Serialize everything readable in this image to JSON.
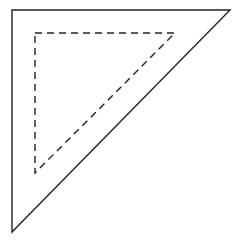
{
  "diagram": {
    "width": 240,
    "height": 240,
    "background": "#ffffff",
    "outer_triangle": {
      "points": "12,10 230,10 12,232",
      "stroke": "#222222",
      "stroke_width": 1.4,
      "dash": "none"
    },
    "inner_triangle": {
      "points": "35,33 175,33 35,173",
      "stroke": "#222222",
      "stroke_width": 1.4,
      "dash": "7,5"
    }
  }
}
